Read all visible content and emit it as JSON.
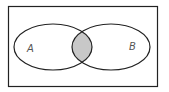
{
  "diagram": {
    "type": "venn",
    "universe": {
      "x": 8.5,
      "y": 6.5,
      "width": 149,
      "height": 80
    },
    "sets": [
      {
        "label": "A",
        "cx": 53,
        "cy": 47,
        "rx": 39,
        "ry": 23,
        "label_x": 27,
        "label_y": 52
      },
      {
        "label": "B",
        "cx": 111,
        "cy": 47,
        "rx": 39,
        "ry": 23,
        "label_x": 129,
        "label_y": 50
      }
    ],
    "shaded_region": "A ∩ B",
    "colors": {
      "stroke": "#222222",
      "shade": "#c8c8c8",
      "background": "#ffffff"
    }
  }
}
